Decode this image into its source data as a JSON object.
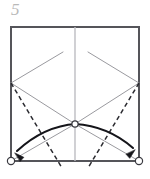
{
  "diagram": {
    "step_label": "5",
    "kind": "origami-crease-pattern",
    "canvas": {
      "width": 150,
      "height": 179
    },
    "colors": {
      "paper_edge": "#55555a",
      "crease_existing": "#9a9a9f",
      "crease_center": "#bdbdc2",
      "fold_line_dashed": "#2b2b30",
      "arrow": "#15151a",
      "marker_stroke": "#3a3a40",
      "marker_fill": "#ffffff",
      "step_number": "#b9b9b9",
      "background": "#ffffff"
    },
    "paper": {
      "shape": "square",
      "left": 11,
      "top": 27,
      "right": 139,
      "bottom": 161,
      "edge_width": 2.0
    },
    "points": {
      "top_left": [
        11,
        27
      ],
      "top_right": [
        139,
        27
      ],
      "bottom_left": [
        11,
        161
      ],
      "bottom_right": [
        139,
        161
      ],
      "left_vertex": [
        11,
        83
      ],
      "right_vertex": [
        139,
        83
      ],
      "center": [
        75,
        124
      ],
      "center_top": [
        75,
        27
      ],
      "center_bottom": [
        75,
        161
      ],
      "diag_left_tip": [
        63,
        52
      ],
      "diag_right_tip": [
        88,
        52
      ]
    },
    "center_crease": {
      "name": "vertical-center-crease",
      "from": [
        75,
        27
      ],
      "to": [
        75,
        161
      ],
      "width": 1.4,
      "style": "solid"
    },
    "existing_creases": [
      {
        "name": "crease-left-vertex-to-center",
        "from": [
          11,
          83
        ],
        "to": [
          75,
          124
        ],
        "style": "solid",
        "width": 1.0
      },
      {
        "name": "crease-right-vertex-to-center",
        "from": [
          139,
          83
        ],
        "to": [
          75,
          124
        ],
        "style": "solid",
        "width": 1.0
      },
      {
        "name": "crease-left-vertex-to-top-center",
        "from": [
          11,
          83
        ],
        "to": [
          63,
          52
        ],
        "style": "solid",
        "width": 1.0
      },
      {
        "name": "crease-right-vertex-to-top-center",
        "from": [
          139,
          83
        ],
        "to": [
          88,
          52
        ],
        "style": "solid",
        "width": 1.0
      },
      {
        "name": "crease-center-to-bottom-left",
        "from": [
          75,
          124
        ],
        "to": [
          11,
          161
        ],
        "style": "solid",
        "width": 1.0
      },
      {
        "name": "crease-center-to-bottom-right",
        "from": [
          75,
          124
        ],
        "to": [
          139,
          161
        ],
        "style": "solid",
        "width": 1.0
      }
    ],
    "fold_lines": [
      {
        "name": "fold-line-left",
        "from": [
          11,
          83
        ],
        "to": [
          62,
          168
        ],
        "style": "dashed",
        "dash": "4.5,3.2",
        "width": 1.5
      },
      {
        "name": "fold-line-right",
        "from": [
          139,
          83
        ],
        "to": [
          88,
          168
        ],
        "style": "dashed",
        "dash": "4.5,3.2",
        "width": 1.5
      }
    ],
    "arrows": [
      {
        "name": "fold-arrow-left",
        "direction": "down-left",
        "path": "M 76 124 Q 44 126 17 151",
        "head_tip": [
          15,
          153
        ],
        "head_angle": 222,
        "width": 2.1
      },
      {
        "name": "fold-arrow-right",
        "direction": "down-right",
        "path": "M 75 124 Q 108 126 133 148",
        "head_tip": [
          135,
          150
        ],
        "head_angle": 318,
        "width": 2.1
      }
    ],
    "markers": [
      {
        "name": "reference-point-center",
        "cx": 75,
        "cy": 124,
        "r": 3.1,
        "style": "open-circle"
      },
      {
        "name": "reference-point-bottom-left",
        "cx": 11,
        "cy": 161,
        "r": 3.6,
        "style": "open-circle"
      },
      {
        "name": "reference-point-bottom-right",
        "cx": 139,
        "cy": 161,
        "r": 3.6,
        "style": "open-circle"
      }
    ]
  }
}
